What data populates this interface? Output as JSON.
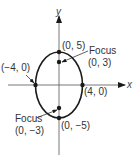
{
  "axes": {
    "x_label": "x",
    "y_label": "y"
  },
  "ellipse": {
    "center": [
      0,
      0
    ],
    "semi_major_axis": 5,
    "semi_minor_axis": 4,
    "major_axis": "vertical"
  },
  "points": {
    "top_vertex": "(0, 5)",
    "bottom_vertex": "(0, −5)",
    "left_vertex": "(−4, 0)",
    "right_vertex": "(4, 0)"
  },
  "foci": {
    "upper": {
      "label": "Focus",
      "coords": "(0, 3)"
    },
    "lower": {
      "label": "Focus",
      "coords": "(0, −3)"
    }
  },
  "colors": {
    "stroke": "#1a1a1a",
    "text": "#333333",
    "background": "#ffffff"
  }
}
